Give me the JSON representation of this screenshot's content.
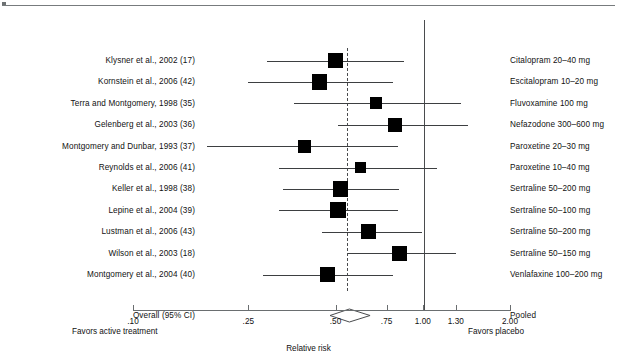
{
  "figure": {
    "axis_title": "Relative risk",
    "left_caption": "Favors active treatment",
    "right_caption": "Favors placebo",
    "overall_label": "Overall (95% CI)",
    "overall_drug_label": "Pooled",
    "marker_color": "#000000",
    "line_color": "#3d3f41",
    "null_line_color": "#4a4c4e"
  },
  "chart_data": {
    "type": "forest",
    "title": "",
    "xlabel": "Relative risk",
    "ylabel": "",
    "xscale": "log",
    "xlim": [
      0.1,
      2.0
    ],
    "tick_values": [
      0.1,
      0.25,
      0.5,
      0.75,
      1.0,
      1.3,
      2.0
    ],
    "tick_labels": [
      ".10",
      ".25",
      ".50",
      ".75",
      "1.00",
      "1.30",
      "2.00"
    ],
    "grid": false,
    "null_line": 1.0,
    "pooled_line": 0.56,
    "left_caption": "Favors active treatment",
    "right_caption": "Favors placebo",
    "legend": "none",
    "rows": [
      {
        "study": "Klysner et al., 2002 (17)",
        "drug": "Citalopram 20–40 mg",
        "rr": 0.5,
        "ci_low": 0.29,
        "ci_high": 0.86,
        "weight": 4.2
      },
      {
        "study": "Kornstein et al., 2006 (42)",
        "drug": "Escitalopram 10–20 mg",
        "rr": 0.44,
        "ci_low": 0.25,
        "ci_high": 0.79,
        "weight": 4.5
      },
      {
        "study": "Terra and Montgomery, 1998 (35)",
        "drug": "Fluvoxamine 100 mg",
        "rr": 0.69,
        "ci_low": 0.36,
        "ci_high": 1.36,
        "weight": 3.0
      },
      {
        "study": "Gelenberg et al., 2003 (36)",
        "drug": "Nefazodone 300–600 mg",
        "rr": 0.8,
        "ci_low": 0.51,
        "ci_high": 1.43,
        "weight": 3.8
      },
      {
        "study": "Montgomery and Dunbar, 1993 (37)",
        "drug": "Paroxetine 20–30 mg",
        "rr": 0.39,
        "ci_low": 0.18,
        "ci_high": 0.82,
        "weight": 3.5
      },
      {
        "study": "Reynolds et al., 2006 (41)",
        "drug": "Paroxetine 10–40 mg",
        "rr": 0.61,
        "ci_low": 0.32,
        "ci_high": 1.12,
        "weight": 2.8
      },
      {
        "study": "Keller et al., 1998 (38)",
        "drug": "Sertraline 50–200 mg",
        "rr": 0.52,
        "ci_low": 0.33,
        "ci_high": 0.83,
        "weight": 4.6
      },
      {
        "study": "Lepine et al., 2004 (39)",
        "drug": "Sertraline 50–100 mg",
        "rr": 0.51,
        "ci_low": 0.32,
        "ci_high": 0.82,
        "weight": 4.6
      },
      {
        "study": "Lustman et al., 2006 (43)",
        "drug": "Sertraline 50–200 mg",
        "rr": 0.65,
        "ci_low": 0.45,
        "ci_high": 0.99,
        "weight": 4.4
      },
      {
        "study": "Wilson et al., 2003 (18)",
        "drug": "Sertraline 50–150 mg",
        "rr": 0.83,
        "ci_low": 0.55,
        "ci_high": 1.3,
        "weight": 4.3
      },
      {
        "study": "Montgomery et al., 2004 (40)",
        "drug": "Venlafaxine 100–200 mg",
        "rr": 0.47,
        "ci_low": 0.28,
        "ci_high": 0.79,
        "weight": 4.4
      }
    ],
    "overall": {
      "study": "Overall (95% CI)",
      "drug": "Pooled",
      "rr": 0.56,
      "ci_low": 0.48,
      "ci_high": 0.66
    }
  }
}
